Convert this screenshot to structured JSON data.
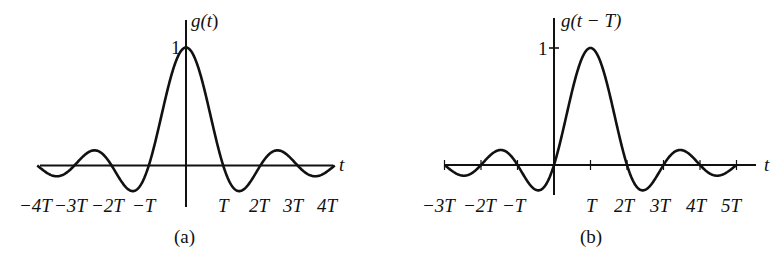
{
  "chart_data": [
    {
      "type": "line",
      "panel": "(a)",
      "title": "",
      "ylabel": "g(t)",
      "xlabel": "t",
      "y_tick_labels": [
        "1"
      ],
      "x_tick_labels": [
        "−4T",
        "−3T",
        "−2T",
        "−T",
        "T",
        "2T",
        "3T",
        "4T"
      ],
      "function": "g(t) = sinc(t/T) = sin(πt/T)/(πt/T)",
      "x_range_T": [
        -4,
        4
      ],
      "peak": {
        "t": 0,
        "value": 1
      },
      "zero_crossings_T": [
        -4,
        -3,
        -2,
        -1,
        1,
        2,
        3,
        4
      ],
      "x": [
        -4,
        -3.5,
        -3,
        -2.5,
        -2,
        -1.5,
        -1,
        -0.5,
        0,
        0.5,
        1,
        1.5,
        2,
        2.5,
        3,
        3.5,
        4
      ],
      "values": [
        0,
        -0.091,
        0,
        0.127,
        0,
        -0.212,
        0,
        0.637,
        1,
        0.637,
        0,
        -0.212,
        0,
        0.127,
        0,
        -0.091,
        0
      ],
      "caption": "(a)"
    },
    {
      "type": "line",
      "panel": "(b)",
      "title": "",
      "ylabel": "g(t − T)",
      "xlabel": "t",
      "y_tick_labels": [
        "1"
      ],
      "x_tick_labels": [
        "−3T",
        "−2T",
        "−T",
        "T",
        "2T",
        "3T",
        "4T",
        "5T"
      ],
      "function": "g(t − T) = sinc((t − T)/T)",
      "x_range_T": [
        -3,
        5
      ],
      "peak": {
        "t": 1,
        "value": 1
      },
      "zero_crossings_T": [
        -3,
        -2,
        -1,
        0,
        2,
        3,
        4,
        5
      ],
      "x": [
        -3,
        -2.5,
        -2,
        -1.5,
        -1,
        -0.5,
        0,
        0.5,
        1,
        1.5,
        2,
        2.5,
        3,
        3.5,
        4,
        4.5,
        5
      ],
      "values": [
        0,
        -0.091,
        0,
        0.127,
        0,
        -0.212,
        0,
        0.637,
        1,
        0.637,
        0,
        -0.212,
        0,
        0.127,
        0,
        -0.091,
        0
      ],
      "caption": "(b)"
    }
  ],
  "panels": {
    "a": {
      "ylabel_prefix": "g(",
      "ylabel_var": "t",
      "ylabel_suffix": ")",
      "one": "1",
      "t": "t",
      "ticks": [
        "−4T",
        "−3T",
        "−2T",
        "−T",
        "T",
        "2T",
        "3T",
        "4T"
      ],
      "caption": "(a)"
    },
    "b": {
      "ylabel": "g(t − T)",
      "one": "1",
      "t": "t",
      "ticks": [
        "−3T",
        "−2T",
        "−T",
        "T",
        "2T",
        "3T",
        "4T",
        "5T"
      ],
      "caption": "(b)"
    }
  },
  "colors": {
    "ink": "#111111",
    "background": "#ffffff"
  }
}
